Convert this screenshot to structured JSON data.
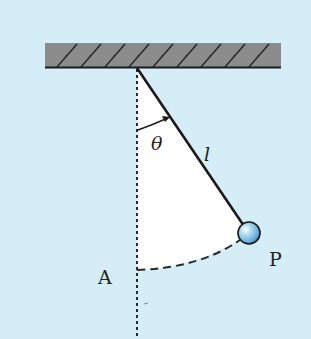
{
  "diagram": {
    "labels": {
      "angle": "θ",
      "length": "l",
      "bob": "P",
      "lowest_point": "A"
    },
    "colors": {
      "background": "#d5edf6",
      "ceiling_fill": "#8c8c8c",
      "ceiling_hatch": "#2a2a2a",
      "string": "#1a1a1a",
      "sector_fill": "#ffffff",
      "bob_fill": "#8fcbeb",
      "dash": "#2a2a2a"
    },
    "geometry": {
      "pivot": [
        137,
        68
      ],
      "bob_center": [
        249,
        233
      ],
      "bob_radius": 11,
      "lowest_point": [
        137,
        270
      ]
    }
  }
}
